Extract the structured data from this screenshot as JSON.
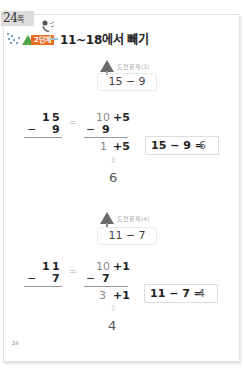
{
  "page_tab": {
    "number": "24",
    "unit": "쪽"
  },
  "header": {
    "step_label": "2단계",
    "title": "11~18에서 빼기",
    "colors": {
      "step_badge": "#e96b1f",
      "tree": "#55a546"
    }
  },
  "problems": [
    {
      "caption": "도전문제(3)",
      "expression": "15 − 9",
      "vertical": {
        "top_tens": "1",
        "top_ones": "5",
        "minus": "−",
        "bottom": "9"
      },
      "decomposed": {
        "row1_left": "10",
        "row1_right": "+5",
        "row2_minus": "−",
        "row2": "9",
        "row3_left": "1",
        "row3_right": "+5"
      },
      "equals_sign": "=",
      "arrow": "⇩",
      "answer": "6",
      "result_lhs": "15 − 9 =",
      "result_rhs": "6"
    },
    {
      "caption": "도전문제(4)",
      "expression": "11 − 7",
      "vertical": {
        "top_tens": "1",
        "top_ones": "1",
        "minus": "−",
        "bottom": "7"
      },
      "decomposed": {
        "row1_left": "10",
        "row1_right": "+1",
        "row2_minus": "−",
        "row2": "7",
        "row3_left": "3",
        "row3_right": "+1"
      },
      "equals_sign": "=",
      "arrow": "⇩",
      "answer": "4",
      "result_lhs": "11 − 7 =",
      "result_rhs": "4"
    }
  ],
  "footer": {
    "page_number": "24"
  }
}
